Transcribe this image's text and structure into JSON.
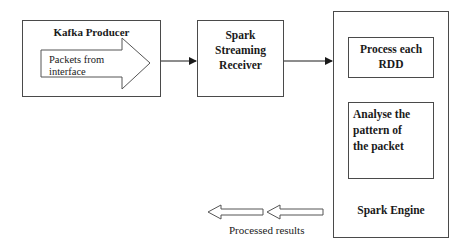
{
  "diagram": {
    "kafka_producer": {
      "title": "Kafka Producer",
      "arrow_label_line1": "Packets from",
      "arrow_label_line2": "interface"
    },
    "spark_receiver": {
      "line1": "Spark",
      "line2": "Streaming",
      "line3": "Receiver"
    },
    "spark_engine": {
      "title": "Spark Engine",
      "step1_line1": "Process each",
      "step1_line2": "RDD",
      "step2_line1": "Analyse the",
      "step2_line2": "pattern of",
      "step2_line3": "the packet"
    },
    "output": {
      "label": "Processed results"
    },
    "colors": {
      "stroke": "#4a4a4a",
      "text": "#1a1a1a",
      "background": "#ffffff"
    }
  }
}
